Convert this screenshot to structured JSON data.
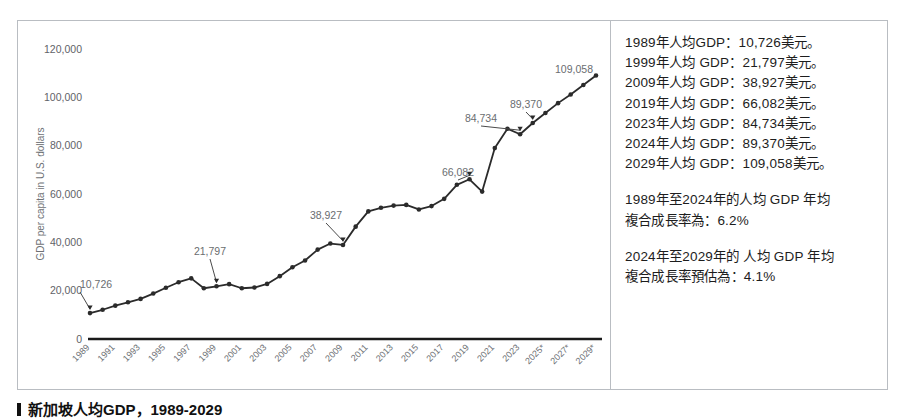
{
  "figure": {
    "caption": "新加坡人均GDP，1989-2029"
  },
  "chart_data": {
    "type": "line",
    "title": "",
    "xlabel": "",
    "ylabel": "GDP per capita in U.S. dollars",
    "ylim": [
      0,
      120000
    ],
    "y_ticks": [
      "0",
      "20,000",
      "40,000",
      "60,000",
      "80,000",
      "100,000",
      "120,000"
    ],
    "y_tick_values": [
      0,
      20000,
      40000,
      60000,
      80000,
      100000,
      120000
    ],
    "grid": false,
    "legend": "none",
    "x_tick_labels": [
      "1989",
      "1991",
      "1993",
      "1995",
      "1997",
      "1999",
      "2001",
      "2003",
      "2005",
      "2007",
      "2009",
      "2011",
      "2013",
      "2015",
      "2017",
      "2019",
      "2021",
      "2023",
      "2025*",
      "2027*",
      "2029*"
    ],
    "x": [
      1989,
      1990,
      1991,
      1992,
      1993,
      1994,
      1995,
      1996,
      1997,
      1998,
      1999,
      2000,
      2001,
      2002,
      2003,
      2004,
      2005,
      2006,
      2007,
      2008,
      2009,
      2010,
      2011,
      2012,
      2013,
      2014,
      2015,
      2016,
      2017,
      2018,
      2019,
      2020,
      2021,
      2022,
      2023,
      2024,
      2025,
      2026,
      2027,
      2028,
      2029
    ],
    "values": [
      10726,
      12100,
      13800,
      15200,
      16600,
      18800,
      21200,
      23500,
      25100,
      21000,
      21797,
      22700,
      21000,
      21300,
      22800,
      26000,
      29700,
      32500,
      37000,
      39500,
      38927,
      46500,
      52800,
      54300,
      55200,
      55500,
      53600,
      55000,
      58000,
      63800,
      66082,
      61000,
      79000,
      87000,
      84734,
      89370,
      93500,
      97600,
      101200,
      105100,
      109058
    ],
    "annotations": [
      {
        "year": 1989,
        "label": "10,726",
        "value": 10726
      },
      {
        "year": 1999,
        "label": "21,797",
        "value": 21797
      },
      {
        "year": 2009,
        "label": "38,927",
        "value": 38927
      },
      {
        "year": 2019,
        "label": "66,082",
        "value": 66082
      },
      {
        "year": 2023,
        "label": "84,734",
        "value": 84734
      },
      {
        "year": 2024,
        "label": "89,370",
        "value": 89370
      },
      {
        "year": 2029,
        "label": "109,058",
        "value": 109058
      }
    ],
    "marker": "circle",
    "line_color": "#2b2b2b"
  },
  "sidebar": {
    "facts": [
      "1989年人均GDP：10,726美元。",
      "1999年人均 GDP：21,797美元。",
      "2009年人均 GDP：38,927美元。",
      "2019年人均 GDP：66,082美元。",
      "2023年人均 GDP：84,734美元。",
      "2024年人均 GDP：89,370美元。",
      "2029年人均 GDP：109,058美元。"
    ],
    "cagr_historical_line1": "1989年至2024年的人均 GDP 年均",
    "cagr_historical_line2": "複合成長率為：6.2%",
    "cagr_forecast_line1": "2024年至2029年的 人均 GDP 年均",
    "cagr_forecast_line2": "複合成長率預估為：4.1%"
  }
}
